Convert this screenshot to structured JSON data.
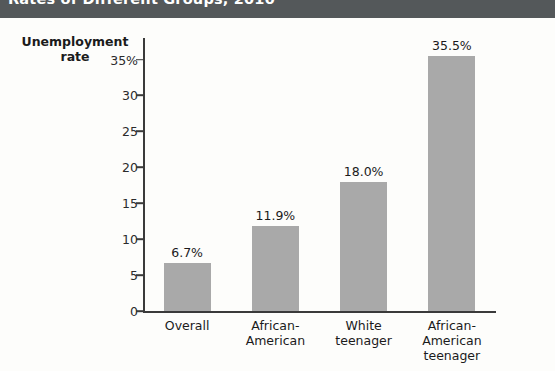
{
  "header": {
    "title": "Rates of Different Groups, 2010"
  },
  "chart_data": {
    "type": "bar",
    "title": "Rates of Different Groups, 2010",
    "xlabel": "",
    "ylabel": "Unemployment rate",
    "ylim": [
      0,
      38
    ],
    "grid": false,
    "legend": null,
    "categories": [
      "Overall",
      "African-\nAmerican",
      "White\nteenager",
      "African-\nAmerican\nteenager"
    ],
    "values": [
      6.7,
      11.9,
      18.0,
      35.5
    ],
    "value_labels": [
      "6.7%",
      "11.9%",
      "18.0%",
      "35.5%"
    ],
    "ytick_labels": [
      "35%",
      "30",
      "25",
      "20",
      "15",
      "10",
      "5",
      "0"
    ],
    "ytick_values": [
      35,
      30,
      25,
      20,
      15,
      10,
      5,
      0
    ],
    "bar_color": "#a9a9a9",
    "axis_color": "#3a3a3a",
    "header_band_color": "#54585a",
    "background_color": "#fdfdfb"
  }
}
